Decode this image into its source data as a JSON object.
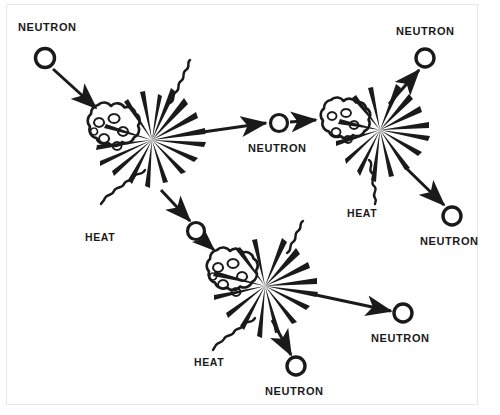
{
  "figure": {
    "background_color": "#ffffff",
    "ink_color": "#1a1a1a",
    "border_color": "#e8e8e8",
    "width": 500,
    "height": 415
  },
  "labels": {
    "neutron_incoming": "NEUTRON",
    "neutron_middle": "NEUTRON",
    "neutron_top_right": "NEUTRON",
    "neutron_right": "NEUTRON",
    "neutron_bottom_left": "NEUTRON",
    "neutron_bottom_right": "NEUTRON",
    "neutron_bottom_center": "NEUTRON",
    "heat_left": "HEAT",
    "heat_right": "HEAT",
    "heat_bottom": "HEAT"
  },
  "nodes": {
    "fission_1": {
      "label": "fission-event-1",
      "cloud_cx": 110,
      "cloud_cy": 130,
      "burst_cx": 152,
      "burst_cy": 140
    },
    "fission_2": {
      "label": "fission-event-2",
      "cloud_cx": 342,
      "cloud_cy": 124,
      "burst_cx": 380,
      "burst_cy": 130
    },
    "fission_3": {
      "label": "fission-event-3",
      "cloud_cx": 229,
      "cloud_cy": 276,
      "burst_cx": 265,
      "burst_cy": 286
    }
  },
  "neutrons": [
    {
      "name": "neutron-incoming",
      "cx": 45,
      "cy": 58,
      "r": 10
    },
    {
      "name": "neutron-middle",
      "cx": 279,
      "cy": 123,
      "r": 9
    },
    {
      "name": "neutron-top-right",
      "cx": 425,
      "cy": 58,
      "r": 10
    },
    {
      "name": "neutron-right",
      "cx": 452,
      "cy": 216,
      "r": 10
    },
    {
      "name": "neutron-bottom-left",
      "cx": 196,
      "cy": 231,
      "r": 10
    },
    {
      "name": "neutron-bottom-right",
      "cx": 403,
      "cy": 313,
      "r": 10
    },
    {
      "name": "neutron-bottom-center",
      "cx": 296,
      "cy": 366,
      "r": 10
    }
  ],
  "label_positions": {
    "neutron_incoming": {
      "x": 18,
      "y": 22
    },
    "neutron_middle": {
      "x": 248,
      "y": 143
    },
    "neutron_top_right": {
      "x": 396,
      "y": 26
    },
    "neutron_right": {
      "x": 420,
      "y": 236
    },
    "neutron_bottom_right": {
      "x": 371,
      "y": 333
    },
    "neutron_bottom_center": {
      "x": 265,
      "y": 386
    },
    "heat_left": {
      "x": 85,
      "y": 232
    },
    "heat_right": {
      "x": 347,
      "y": 208
    },
    "heat_bottom": {
      "x": 194,
      "y": 357
    }
  }
}
